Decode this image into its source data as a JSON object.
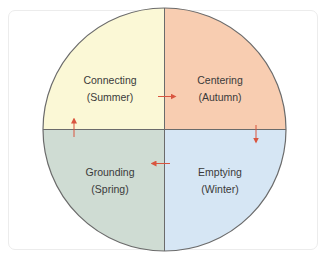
{
  "diagram": {
    "type": "four-quadrant-cycle",
    "quadrants": [
      {
        "position": "top-left",
        "title": "Connecting",
        "subtitle": "(Summer)",
        "color": "#fbf8d6"
      },
      {
        "position": "top-right",
        "title": "Centering",
        "subtitle": "(Autumn)",
        "color": "#f8cdb1"
      },
      {
        "position": "bottom-right",
        "title": "Emptying",
        "subtitle": "(Winter)",
        "color": "#d6e6f4"
      },
      {
        "position": "bottom-left",
        "title": "Grounding",
        "subtitle": "(Spring)",
        "color": "#cfdcd3"
      }
    ],
    "flow": [
      {
        "from": "Connecting",
        "to": "Centering",
        "direction": "right"
      },
      {
        "from": "Centering",
        "to": "Emptying",
        "direction": "down"
      },
      {
        "from": "Emptying",
        "to": "Grounding",
        "direction": "left"
      },
      {
        "from": "Grounding",
        "to": "Connecting",
        "direction": "up"
      }
    ],
    "colors": {
      "outline": "#6b6b6b",
      "arrow": "#d9553f",
      "text": "#3a3a3a"
    }
  }
}
